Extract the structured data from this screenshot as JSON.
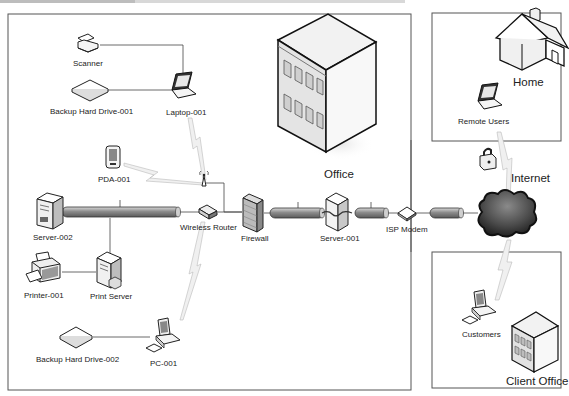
{
  "zones": {
    "office": "Office",
    "home": "Home",
    "internet": "Internet",
    "client_office": "Client Office"
  },
  "devices": {
    "scanner": "Scanner",
    "backup_hd_001": "Backup Hard Drive-001",
    "laptop_001": "Laptop-001",
    "pda_001": "PDA-001",
    "server_002": "Server-002",
    "wireless_router": "Wireless Router",
    "firewall": "Firewall",
    "server_001": "Server-001",
    "isp_modem": "ISP Modem",
    "printer_001": "Printer-001",
    "print_server": "Print Server",
    "backup_hd_002": "Backup Hard Drive-002",
    "pc_001": "PC-001",
    "remote_users": "Remote Users",
    "customers": "Customers"
  },
  "icons": {
    "scanner": "scanner-icon",
    "hard_drive": "hard-drive-icon",
    "laptop": "laptop-icon",
    "pda": "pda-icon",
    "server": "server-icon",
    "router": "router-icon",
    "antenna": "antenna-icon",
    "firewall": "firewall-icon",
    "modem": "modem-icon",
    "printer": "printer-icon",
    "pc": "pc-icon",
    "building": "building-icon",
    "house": "house-icon",
    "cloud": "cloud-icon",
    "lock": "lock-icon",
    "bus": "ethernet-bus"
  },
  "colors": {
    "border": "#555555",
    "line": "#444444",
    "bus_fill": "#9a9a9a",
    "cloud": "#3a3a3a",
    "lightning": "#d9d9d9"
  }
}
